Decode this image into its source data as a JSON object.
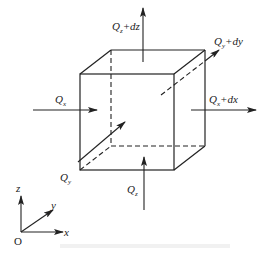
{
  "diagram": {
    "cube": {
      "front_face": {
        "x1": 80,
        "y1": 74,
        "x2": 174,
        "y2": 170
      },
      "depth_offset": {
        "dx": 31,
        "dy": -24
      }
    },
    "fluxes": [
      {
        "id": "qx_in",
        "symbol": "Q",
        "sub": "x",
        "suffix": "",
        "direction": "+x"
      },
      {
        "id": "qx_out",
        "symbol": "Q",
        "sub": "x",
        "suffix": "+dx",
        "direction": "+x"
      },
      {
        "id": "qy_in",
        "symbol": "Q",
        "sub": "y",
        "suffix": "",
        "direction": "+y"
      },
      {
        "id": "qy_out",
        "symbol": "Q",
        "sub": "y",
        "suffix": "+dy",
        "direction": "+y"
      },
      {
        "id": "qz_in",
        "symbol": "Q",
        "sub": "z",
        "suffix": "",
        "direction": "+z"
      },
      {
        "id": "qz_out",
        "symbol": "Q",
        "sub": "z",
        "suffix": "+dz",
        "direction": "+z"
      }
    ],
    "labels": {
      "qx_in": {
        "main": "Q",
        "sub": "x",
        "suffix": ""
      },
      "qx_out": {
        "main": "Q",
        "sub": "x",
        "suffix": "+dx"
      },
      "qy_in": {
        "main": "Q",
        "sub": "y",
        "suffix": ""
      },
      "qy_out": {
        "main": "Q",
        "sub": "y",
        "suffix": "+dy"
      },
      "qz_in": {
        "main": "Q",
        "sub": "z",
        "suffix": ""
      },
      "qz_out": {
        "main": "Q",
        "sub": "z",
        "suffix": "+dz"
      }
    },
    "axes": {
      "origin": "O",
      "x": "x",
      "y": "y",
      "z": "z"
    },
    "colors": {
      "stroke": "#222222",
      "background": "#ffffff"
    }
  }
}
